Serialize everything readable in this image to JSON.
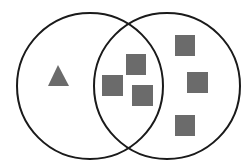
{
  "diagram": {
    "type": "venn",
    "colors": {
      "background": "#ffffff",
      "outline": "#1a1a1a",
      "shape_fill": "#6b6b6b"
    },
    "sets": [
      {
        "name": "left-set",
        "cx": 90,
        "cy": 86,
        "r": 73
      },
      {
        "name": "right-set",
        "cx": 167,
        "cy": 86,
        "r": 73
      }
    ],
    "items": [
      {
        "shape": "triangle",
        "region": "left-only",
        "points": "58,65 48,86 69,86"
      },
      {
        "shape": "square",
        "region": "intersection",
        "x": 126,
        "y": 54,
        "w": 20,
        "h": 21
      },
      {
        "shape": "square",
        "region": "intersection",
        "x": 102,
        "y": 75,
        "w": 21,
        "h": 21
      },
      {
        "shape": "square",
        "region": "intersection",
        "x": 132,
        "y": 85,
        "w": 21,
        "h": 21
      },
      {
        "shape": "square",
        "region": "right-only",
        "x": 175,
        "y": 35,
        "w": 20,
        "h": 21
      },
      {
        "shape": "square",
        "region": "right-only",
        "x": 187,
        "y": 72,
        "w": 21,
        "h": 21
      },
      {
        "shape": "square",
        "region": "right-only",
        "x": 175,
        "y": 115,
        "w": 20,
        "h": 21
      }
    ],
    "counts": {
      "left_only_triangles": 1,
      "intersection_squares": 3,
      "right_only_squares": 3
    }
  }
}
